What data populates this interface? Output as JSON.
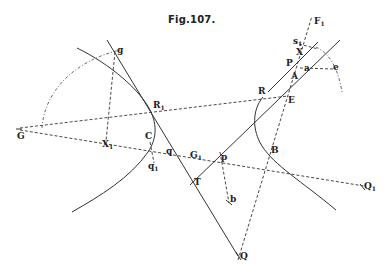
{
  "figure": {
    "title": "Fig.107."
  },
  "labels": {
    "G": "G",
    "g": "g",
    "R1": "R",
    "R1_sub": "1",
    "X1": "X",
    "X1_sub": "1",
    "C": "C",
    "q": "q",
    "q1": "q",
    "q1_sub": "1",
    "G1": "G",
    "G1_sub": "1",
    "p": "p",
    "T": "T",
    "b": "b",
    "Q": "Q",
    "B": "B",
    "Q1": "Q",
    "Q1_sub": "1",
    "R": "R",
    "E": "E",
    "A": "A",
    "P": "P",
    "a": "a",
    "X": "X",
    "s1": "s",
    "s1_sub": "1",
    "F1": "F",
    "F1_sub": "1",
    "e": "e"
  },
  "colors": {
    "ink": "#333333",
    "background": "#ffffff"
  }
}
